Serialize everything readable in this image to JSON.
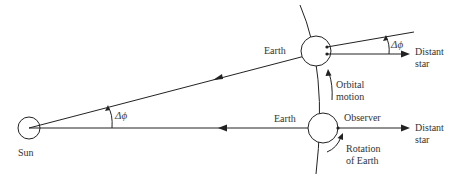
{
  "diagram": {
    "labels": {
      "sun": "Sun",
      "earth_top": "Earth",
      "earth_bottom": "Earth",
      "observer": "Observer",
      "distant_star_top_line1": "Distant",
      "distant_star_top_line2": "star",
      "distant_star_bottom_line1": "Distant",
      "distant_star_bottom_line2": "star",
      "orbital_motion_line1": "Orbital",
      "orbital_motion_line2": "motion",
      "rotation_line1": "Rotation",
      "rotation_line2": "of Earth",
      "angle_sun": "Δϕ",
      "angle_star": "Δϕ"
    },
    "colors": {
      "stroke": "#222222",
      "text": "#333333",
      "background": "#ffffff"
    }
  }
}
